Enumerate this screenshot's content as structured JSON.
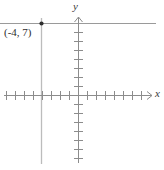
{
  "figure": {
    "kind": "coordinate-plane-graph",
    "width": 164,
    "height": 170,
    "background": "#ffffff"
  },
  "axes": {
    "x_label": "x",
    "y_label": "y",
    "axis_color": "#8c8c8c",
    "origin": {
      "x": 78,
      "y": 95
    },
    "tick_spacing": 9,
    "x_axis": {
      "y_pixel": 95,
      "start_x": 4,
      "end_x": 152,
      "arrow": "right",
      "tick_length": 9,
      "ticks_left_of_origin": 8,
      "ticks_right_of_origin": 8
    },
    "y_axis": {
      "x_pixel": 78,
      "start_y": 163,
      "end_y": 17,
      "arrow": "up",
      "tick_length": 9,
      "ticks_above_origin": 8,
      "ticks_below_origin": 7
    }
  },
  "graph": {
    "point": {
      "label": "(-4, 7)",
      "x_pixel": 41,
      "y_pixel": 23,
      "radius": 2.1,
      "color": "#2e2e2e"
    },
    "horizontal_line": {
      "name": "y = 7",
      "y_pixel": 23,
      "start_x": 0,
      "end_x": 156,
      "color": "#9a9a9a"
    },
    "vertical_line": {
      "name": "x = -4",
      "x_pixel": 41,
      "start_y": 18,
      "end_y": 164,
      "color": "#bcbcbc"
    }
  }
}
